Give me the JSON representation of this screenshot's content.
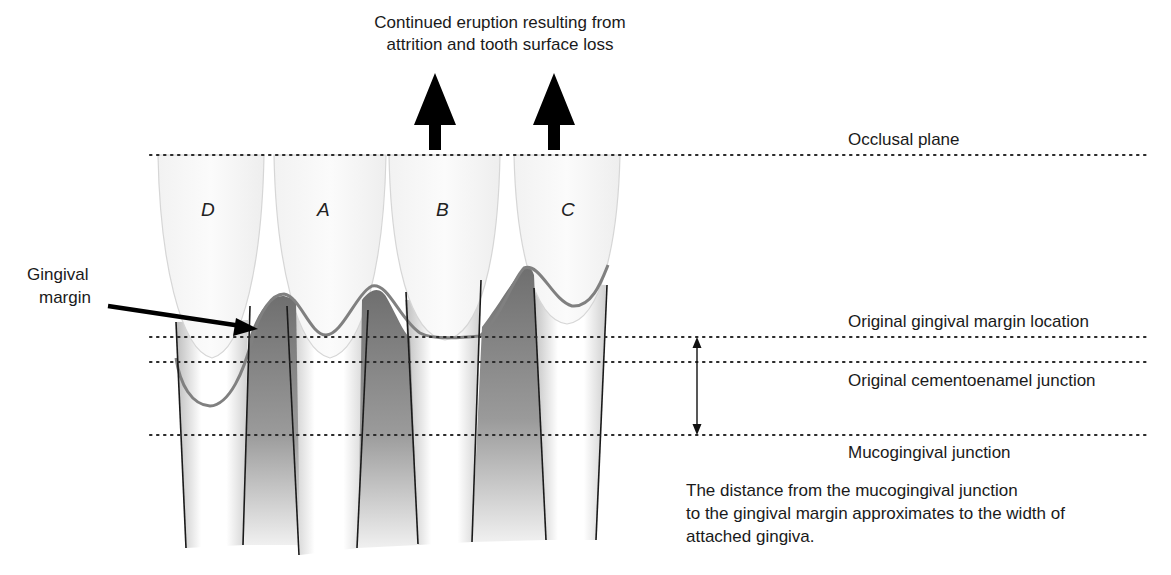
{
  "title": {
    "line1": "Continued eruption resulting from",
    "line2": "attrition and tooth surface loss"
  },
  "teeth": [
    {
      "id": "D",
      "label": "D"
    },
    {
      "id": "A",
      "label": "A"
    },
    {
      "id": "B",
      "label": "B"
    },
    {
      "id": "C",
      "label": "C"
    }
  ],
  "callout": {
    "line1": "Gingival",
    "line2": "margin"
  },
  "reference_lines": {
    "occlusal_plane": "Occlusal plane",
    "original_gingival_margin": "Original gingival margin location",
    "original_cej": "Original cementoenamel junction",
    "mucogingival_junction": "Mucogingival junction"
  },
  "note": {
    "line1": "The distance from the mucogingival junction",
    "line2": "to the gingival margin approximates to the width of",
    "line3": "attached gingiva."
  },
  "colors": {
    "gingiva_fill": "#7a7a7a",
    "gingival_margin_stroke": "#808080",
    "root_line": "#1a1a1a",
    "dotted_line": "#333333",
    "crown_outline": "#d8d8d8"
  }
}
